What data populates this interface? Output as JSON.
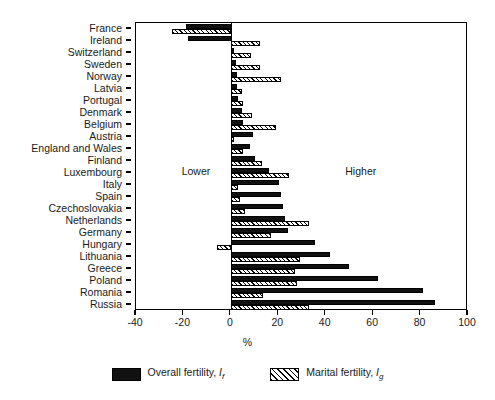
{
  "chart_data": {
    "type": "bar",
    "orientation": "horizontal",
    "title": "",
    "xlabel": "%",
    "ylabel": "",
    "xlim": [
      -40,
      100
    ],
    "xticks": [
      -40,
      -20,
      0,
      20,
      40,
      60,
      80,
      100
    ],
    "xticklabels": [
      "-40",
      "-20",
      "0",
      "20",
      "40",
      "60",
      "80",
      "100"
    ],
    "grid": false,
    "legend_position": "bottom",
    "annotations": [
      {
        "text": "Lower",
        "x": -14,
        "y": "Luxembourg"
      },
      {
        "text": "Higher",
        "x": 55,
        "y": "Luxembourg"
      }
    ],
    "categories": [
      "France",
      "Ireland",
      "Switzerland",
      "Sweden",
      "Norway",
      "Latvia",
      "Portugal",
      "Denmark",
      "Belgium",
      "Austria",
      "England and Wales",
      "Finland",
      "Luxembourg",
      "Italy",
      "Spain",
      "Czechoslovakia",
      "Netherlands",
      "Germany",
      "Hungary",
      "Lithuania",
      "Greece",
      "Poland",
      "Romania",
      "Russia"
    ],
    "series": [
      {
        "name": "Overall fertility, If",
        "label_text": "Overall fertility,",
        "label_symbol": "I",
        "label_subscript": "f",
        "style": "solid",
        "color": "#111111",
        "values": [
          -19,
          -18,
          1.5,
          2,
          2.5,
          2.5,
          3,
          4.5,
          5,
          9.5,
          8,
          10,
          16,
          20.5,
          21,
          22,
          23,
          24,
          35.5,
          42,
          50,
          62,
          81,
          86
        ]
      },
      {
        "name": "Marital fertility, Ig",
        "label_text": "Marital fertility,",
        "label_symbol": "I",
        "label_subscript": "g",
        "style": "hatched",
        "color": "#ffffff",
        "values": [
          -25,
          12.5,
          8.5,
          12.5,
          21,
          4.5,
          5,
          9,
          19,
          1.5,
          5,
          13,
          24.5,
          3,
          4,
          6,
          33,
          17,
          -6,
          29,
          27,
          28,
          13.5,
          33
        ]
      }
    ]
  },
  "legend": {
    "items": [
      {
        "symbol": "I",
        "subscript": "f",
        "text": "Overall fertility,",
        "style": "solid"
      },
      {
        "symbol": "I",
        "subscript": "g",
        "text": "Marital fertility,",
        "style": "hatched"
      }
    ]
  },
  "axis": {
    "x_title": "%"
  }
}
